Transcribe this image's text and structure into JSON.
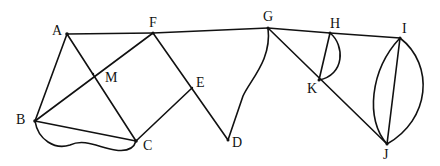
{
  "diagram": {
    "type": "graph",
    "vertices": [
      {
        "id": "A",
        "label": "A",
        "x": 67,
        "y": 34,
        "lx": 52,
        "ly": 35
      },
      {
        "id": "F",
        "label": "F",
        "x": 153,
        "y": 33,
        "lx": 149,
        "ly": 27
      },
      {
        "id": "G",
        "label": "G",
        "x": 268,
        "y": 28,
        "lx": 263,
        "ly": 21
      },
      {
        "id": "H",
        "label": "H",
        "x": 330,
        "y": 33,
        "lx": 330,
        "ly": 28
      },
      {
        "id": "I",
        "label": "I",
        "x": 400,
        "y": 38,
        "lx": 402,
        "ly": 33
      },
      {
        "id": "M",
        "label": "M",
        "x": 93,
        "y": 74,
        "lx": 105,
        "ly": 82
      },
      {
        "id": "E",
        "label": "E",
        "x": 192,
        "y": 88,
        "lx": 196,
        "ly": 87
      },
      {
        "id": "B",
        "label": "B",
        "x": 35,
        "y": 121,
        "lx": 16,
        "ly": 124
      },
      {
        "id": "C",
        "label": "C",
        "x": 136,
        "y": 141,
        "lx": 143,
        "ly": 150
      },
      {
        "id": "D",
        "label": "D",
        "x": 228,
        "y": 140,
        "lx": 232,
        "ly": 147
      },
      {
        "id": "K",
        "label": "K",
        "x": 319,
        "y": 80,
        "lx": 307,
        "ly": 93
      },
      {
        "id": "J",
        "label": "J",
        "x": 387,
        "y": 144,
        "lx": 383,
        "ly": 159
      }
    ],
    "edges": [
      {
        "from": "A",
        "to": "F",
        "shape": "line"
      },
      {
        "from": "F",
        "to": "G",
        "shape": "line"
      },
      {
        "from": "G",
        "to": "H",
        "shape": "line"
      },
      {
        "from": "H",
        "to": "I",
        "shape": "line"
      },
      {
        "from": "A",
        "to": "B",
        "shape": "line"
      },
      {
        "from": "A",
        "to": "C",
        "shape": "line"
      },
      {
        "from": "F",
        "to": "B",
        "shape": "line"
      },
      {
        "from": "F",
        "to": "D",
        "shape": "line"
      },
      {
        "from": "B",
        "to": "C",
        "shape": "line"
      },
      {
        "from": "B",
        "to": "C",
        "shape": "wavy-curve"
      },
      {
        "from": "C",
        "to": "E",
        "shape": "line"
      },
      {
        "from": "G",
        "to": "D",
        "shape": "curve"
      },
      {
        "from": "G",
        "to": "J",
        "shape": "line"
      },
      {
        "from": "H",
        "to": "K",
        "shape": "line"
      },
      {
        "from": "H",
        "to": "K",
        "shape": "arc"
      },
      {
        "from": "I",
        "to": "J",
        "shape": "line"
      },
      {
        "from": "I",
        "to": "J",
        "shape": "arc-left"
      },
      {
        "from": "I",
        "to": "J",
        "shape": "arc-right"
      }
    ],
    "colors": {
      "stroke": "#111111",
      "background": "#ffffff"
    }
  }
}
